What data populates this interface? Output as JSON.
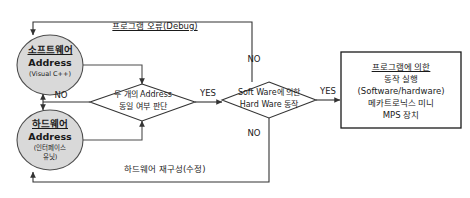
{
  "diagram": {
    "type": "flowchart",
    "title_visible": false,
    "colors": {
      "node_fill": "#d9d9d9",
      "node_stroke": "#4d4d4d",
      "box_stroke": "#1a1a1a",
      "line": "#333333",
      "text": "#1a1a1a",
      "background": "#ffffff"
    },
    "nodes": {
      "software_circle": {
        "line1": "소프트웨어",
        "line2": "Address",
        "line3": "(Visual C++)"
      },
      "hardware_circle": {
        "line1": "하드웨어",
        "line2": "Address",
        "line3": "(인터페이스",
        "line4": "유닛)"
      },
      "decision_one": {
        "line1": "두 개의 Address",
        "line2": "동일 여부 판단"
      },
      "decision_two": {
        "line1": "Soft Ware에 의한",
        "line2": "Hard Ware 동작"
      },
      "result_box": {
        "line1": "프로그램에 의한",
        "line2": "동작 실행",
        "line3": "(Software/hardware)",
        "line4": "메카트로닉스 미니",
        "line5": "MPS 장치"
      }
    },
    "edge_labels": {
      "debug_rail": "프로그램 오류(Debug)",
      "hardware_rail": "하드웨어 재구성(수정)",
      "no_left": "NO",
      "yes_middle": "YES",
      "no_top_right": "NO",
      "no_bottom_right": "NO",
      "yes_right": "YES"
    }
  }
}
